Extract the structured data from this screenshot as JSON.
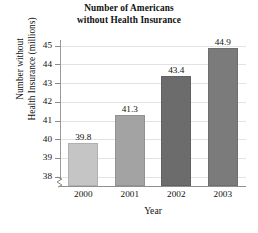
{
  "chart_data": {
    "type": "bar",
    "title": "Number of Americans without Health Insurance",
    "title_line1": "Number of Americans",
    "title_line2": "without Health Insurance",
    "xlabel": "Year",
    "ylabel": "Number without Health Insurance (millions)",
    "ylabel_line1": "Number without",
    "ylabel_line2": "Health Insurance (millions)",
    "categories": [
      "2000",
      "2001",
      "2002",
      "2003"
    ],
    "values": [
      39.8,
      41.3,
      43.4,
      44.9
    ],
    "value_labels": [
      "39.8",
      "41.3",
      "43.4",
      "44.9"
    ],
    "ylim": [
      37.5,
      45.3
    ],
    "yticks": [
      38,
      39,
      40,
      41,
      42,
      43,
      44,
      45
    ],
    "ytick_labels": [
      "38",
      "39",
      "40",
      "41",
      "42",
      "43",
      "44",
      "45"
    ],
    "grid": true,
    "grid_axis": "y",
    "legend": "none",
    "axis_break": true,
    "bar_colors": [
      "#c5c5c5",
      "#a3a3a3",
      "#6c6c6c",
      "#7b7b7b"
    ],
    "grid_color": "#e2e2e2",
    "axis_color": "#8f8f8f",
    "text_color": "#111111",
    "background": "#ffffff"
  }
}
